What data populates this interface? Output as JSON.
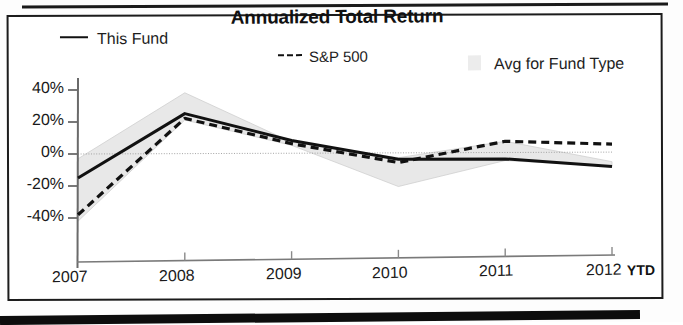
{
  "chart_data": {
    "type": "line",
    "title": "Annualized Total Return",
    "xlabel": "",
    "ylabel": "",
    "categories": [
      "2007",
      "2008",
      "2009",
      "2010",
      "2011",
      "2012"
    ],
    "x_axis_note": "YTD",
    "ylim": [
      -50,
      45
    ],
    "yticks": [
      40,
      20,
      0,
      -20,
      -40
    ],
    "ytick_labels": [
      "40%",
      "20%",
      "0%",
      "-20%",
      "-40%"
    ],
    "grid": false,
    "legend_position": "top",
    "series": [
      {
        "name": "This Fund",
        "style": "solid",
        "color": "#111111",
        "values": [
          -15,
          25,
          8,
          -4,
          -4,
          -9
        ]
      },
      {
        "name": "S&P 500",
        "style": "dashed",
        "color": "#111111",
        "values": [
          -38,
          22,
          6,
          -6,
          7,
          5
        ]
      },
      {
        "name": "Avg for Fund Type",
        "style": "band",
        "color": "#e8e8e8",
        "band_upper": [
          -3,
          38,
          7,
          -3,
          7,
          -6
        ],
        "band_lower": [
          -42,
          21,
          5,
          -21,
          -5,
          -9
        ]
      }
    ]
  },
  "legend": {
    "this_fund": "This Fund",
    "sp500": "S&P 500",
    "avg_fund_type": "Avg for Fund Type"
  },
  "axes": {
    "y_ticks": [
      "40%",
      "20%",
      "0%",
      "-20%",
      "-40%"
    ],
    "x_ticks": [
      "2007",
      "2008",
      "2009",
      "2010",
      "2011",
      "2012"
    ],
    "ytd": "YTD"
  },
  "colors": {
    "line": "#111111",
    "band": "#e8e8e8",
    "axis": "#555555",
    "frame": "#1c1c1c"
  }
}
